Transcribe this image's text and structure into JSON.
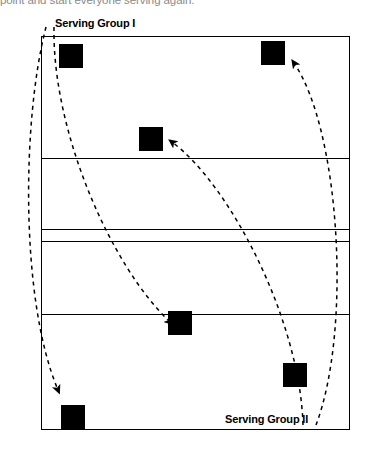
{
  "caption": {
    "text": "point and start everyone serving again."
  },
  "diagram": {
    "court": {
      "x": 41,
      "y": 36,
      "width": 309,
      "height": 394,
      "border_color": "#000000",
      "fill_color": "#ffffff",
      "line_color": "#000000",
      "horizontal_lines_y": [
        157,
        228,
        240,
        313
      ]
    },
    "labels": {
      "group_1": "Serving Group I",
      "group_2": "Serving Group II"
    },
    "players": [
      {
        "name": "player-top-left",
        "x": 59,
        "y": 44,
        "size": 24,
        "color": "#000000"
      },
      {
        "name": "player-top-right",
        "x": 261,
        "y": 41,
        "size": 24,
        "color": "#000000"
      },
      {
        "name": "player-upper-middle",
        "x": 139,
        "y": 127,
        "size": 24,
        "color": "#000000"
      },
      {
        "name": "player-lower-middle",
        "x": 168,
        "y": 311,
        "size": 24,
        "color": "#000000"
      },
      {
        "name": "player-bottom-right",
        "x": 283,
        "y": 363,
        "size": 24,
        "color": "#000000"
      },
      {
        "name": "player-bottom-left",
        "x": 61,
        "y": 405,
        "size": 24,
        "color": "#000000"
      }
    ],
    "arrows": [
      {
        "name": "arrow-group1-outer-to-bottom-left",
        "path": "M 46 27 C 22 120, 20 300, 58 390",
        "dash": "4,4",
        "arrowhead": true
      },
      {
        "name": "arrow-group1-inner-to-lower-middle",
        "path": "M 54 27 C 52 130, 110 265, 170 322",
        "dash": "4,4",
        "arrowhead": true
      },
      {
        "name": "arrow-group2-outer-to-top-right",
        "path": "M 316 425 C 352 330, 340 130, 294 63",
        "dash": "4,4",
        "arrowhead": true
      },
      {
        "name": "arrow-group2-inner-to-upper-middle",
        "path": "M 303 425 C 300 320, 230 185, 172 142",
        "dash": "4,4",
        "arrowhead": true
      }
    ],
    "arrow_color": "#000000"
  }
}
